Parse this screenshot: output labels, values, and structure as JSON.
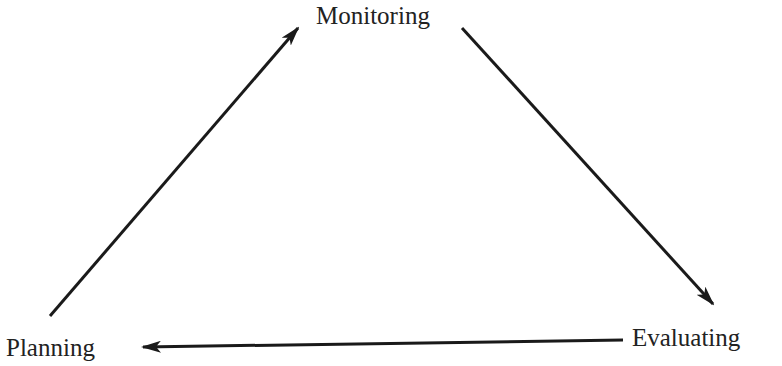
{
  "diagram": {
    "type": "cycle",
    "nodes": [
      {
        "id": "monitoring",
        "label": "Monitoring"
      },
      {
        "id": "evaluating",
        "label": "Evaluating"
      },
      {
        "id": "planning",
        "label": "Planning"
      }
    ],
    "edges": [
      {
        "from": "monitoring",
        "to": "evaluating"
      },
      {
        "from": "evaluating",
        "to": "planning"
      },
      {
        "from": "planning",
        "to": "monitoring"
      }
    ],
    "colors": {
      "line": "#1a1a1a",
      "text": "#222222",
      "background": "#ffffff"
    }
  }
}
